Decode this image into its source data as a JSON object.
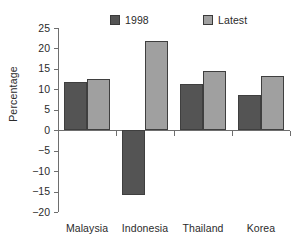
{
  "chart_data": {
    "type": "bar",
    "title": "",
    "xlabel": "",
    "ylabel": "Percentage",
    "categories": [
      "Malaysia",
      "Indonesia",
      "Thailand",
      "Korea"
    ],
    "series": [
      {
        "name": "1998",
        "values": [
          11.7,
          -15.8,
          11.2,
          8.5
        ],
        "color": "#545454"
      },
      {
        "name": "Latest",
        "values": [
          12.5,
          21.9,
          14.4,
          13.2
        ],
        "color": "#a0a0a0"
      }
    ],
    "ylim": [
      -20,
      25
    ],
    "ytick_step": 5,
    "yticks": [
      25,
      20,
      15,
      10,
      5,
      0,
      -5,
      -10,
      -15,
      -20
    ],
    "ytick_labels": [
      "25",
      "20",
      "15",
      "10",
      "5",
      "0",
      "−5",
      "−10",
      "−15",
      "−20"
    ],
    "grid": false,
    "legend_position": "top",
    "zero_line": true
  },
  "colors": {
    "series_1998": "#545454",
    "series_latest": "#a0a0a0",
    "axis": "#6e6e6e",
    "text": "#2b2b2b",
    "background": "#ffffff"
  }
}
